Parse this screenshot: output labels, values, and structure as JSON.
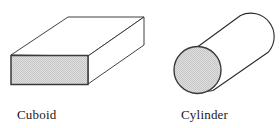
{
  "figure": {
    "background_color": "#ffffff",
    "stroke_color": "#2b2b2b",
    "shaded_fill_color": "#d6d6d6",
    "unshaded_fill_color": "#ffffff",
    "label_color": "#1a1a1a",
    "shapes": [
      {
        "name": "cuboid",
        "label": "Cuboid",
        "faces": [
          {
            "name": "front-face",
            "shaded": true
          },
          {
            "name": "top-face",
            "shaded": false
          },
          {
            "name": "right-face",
            "shaded": false
          }
        ]
      },
      {
        "name": "cylinder",
        "label": "Cylinder",
        "faces": [
          {
            "name": "circular-end-face",
            "shaded": true
          },
          {
            "name": "curved-body-surface",
            "shaded": false
          }
        ]
      }
    ]
  }
}
